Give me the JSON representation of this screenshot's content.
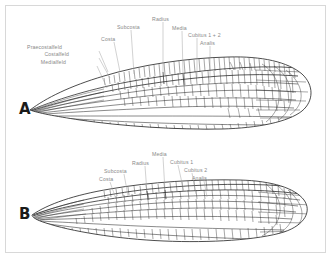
{
  "figure": {
    "background_color": "#ffffff",
    "border_color": "#d8d8d8",
    "label_color": "#8a8a8a",
    "vein_color": "#2b2b2b"
  },
  "panels": [
    {
      "letter": "A",
      "name": "zygoptera-wing",
      "description": "Narrow petiolate damselfly wing",
      "labels": [
        {
          "text": "Praecostalfeld",
          "x": 62,
          "y": 45,
          "anchor": "end",
          "leader": {
            "x1": 99,
            "y1": 51,
            "x2": 108,
            "y2": 72
          }
        },
        {
          "text": "Costalfeld",
          "x": 69,
          "y": 52,
          "anchor": "end",
          "leader": {
            "x1": 99,
            "y1": 58,
            "x2": 110,
            "y2": 78
          }
        },
        {
          "text": "Medialfeld",
          "x": 66,
          "y": 60,
          "anchor": "end",
          "leader": {
            "x1": 97,
            "y1": 66,
            "x2": 107,
            "y2": 88
          }
        },
        {
          "text": "Costa",
          "x": 101,
          "y": 37,
          "anchor": "start",
          "leader": {
            "x1": 114,
            "y1": 42,
            "x2": 120,
            "y2": 72
          }
        },
        {
          "text": "Subcosta",
          "x": 117,
          "y": 25,
          "anchor": "start",
          "leader": {
            "x1": 131,
            "y1": 30,
            "x2": 134,
            "y2": 74
          }
        },
        {
          "text": "Radius",
          "x": 152,
          "y": 17,
          "anchor": "start",
          "leader": {
            "x1": 163,
            "y1": 22,
            "x2": 163,
            "y2": 72
          }
        },
        {
          "text": "Media",
          "x": 172,
          "y": 26,
          "anchor": "start",
          "leader": {
            "x1": 182,
            "y1": 31,
            "x2": 183,
            "y2": 74
          }
        },
        {
          "text": "Cubitus 1 + 2",
          "x": 188,
          "y": 33,
          "anchor": "start",
          "leader": {
            "x1": 197,
            "y1": 38,
            "x2": 197,
            "y2": 78
          }
        },
        {
          "text": "Analis",
          "x": 200,
          "y": 41,
          "anchor": "start",
          "leader": {
            "x1": 210,
            "y1": 46,
            "x2": 210,
            "y2": 82
          }
        }
      ]
    },
    {
      "letter": "B",
      "name": "anisoptera-wing",
      "description": "Broad rounded dragonfly wing",
      "labels": [
        {
          "text": "Costa",
          "x": 99,
          "y": 177,
          "anchor": "start",
          "leader": {
            "x1": 110,
            "y1": 182,
            "x2": 116,
            "y2": 199
          }
        },
        {
          "text": "Subcosta",
          "x": 104,
          "y": 169,
          "anchor": "start",
          "leader": {
            "x1": 124,
            "y1": 174,
            "x2": 128,
            "y2": 196
          }
        },
        {
          "text": "Radius",
          "x": 132,
          "y": 161,
          "anchor": "start",
          "leader": {
            "x1": 145,
            "y1": 166,
            "x2": 147,
            "y2": 193
          }
        },
        {
          "text": "Media",
          "x": 152,
          "y": 152,
          "anchor": "start",
          "leader": {
            "x1": 163,
            "y1": 157,
            "x2": 165,
            "y2": 191
          }
        },
        {
          "text": "Cubitus 1",
          "x": 170,
          "y": 160,
          "anchor": "start",
          "leader": {
            "x1": 178,
            "y1": 165,
            "x2": 184,
            "y2": 192
          }
        },
        {
          "text": "Cubitus 2",
          "x": 184,
          "y": 168,
          "anchor": "start",
          "leader": {
            "x1": 192,
            "y1": 173,
            "x2": 196,
            "y2": 194
          }
        },
        {
          "text": "Analis",
          "x": 192,
          "y": 176,
          "anchor": "start",
          "leader": {
            "x1": 204,
            "y1": 181,
            "x2": 207,
            "y2": 197
          }
        }
      ]
    }
  ]
}
